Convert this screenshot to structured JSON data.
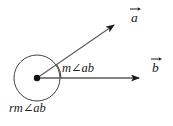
{
  "figure": {
    "type": "geometry-diagram",
    "background_color": "#ffffff",
    "stroke_color": "#1a1a1a",
    "ray_color": "#555555",
    "labels": {
      "angle": "m∠ab",
      "reflex_angle": "rm∠ab",
      "vector_a": "a",
      "vector_b": "b"
    },
    "icons": {
      "vector_a_arrow": "vector-arrow-icon",
      "vector_b_arrow": "vector-arrow-icon"
    },
    "geometry": {
      "vertex": {
        "x": 37,
        "y": 78
      },
      "circle": {
        "cx": 37,
        "cy": 78,
        "r": 23
      },
      "vertex_dot_r": 3.2,
      "ray_a": {
        "x1": 37,
        "y1": 78,
        "x2": 120,
        "y2": 21
      },
      "ray_b": {
        "x1": 37,
        "y1": 78,
        "x2": 146,
        "y2": 78
      },
      "angle_arc": {
        "cx": 37,
        "cy": 78,
        "r": 24,
        "start_deg": 0,
        "end_deg": 34
      },
      "angle_deg": 34
    }
  }
}
